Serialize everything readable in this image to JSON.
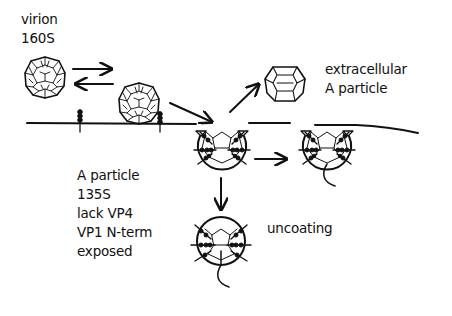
{
  "diagram": {
    "type": "schematic",
    "colors": {
      "ink": "#111111",
      "background": "#ffffff"
    }
  },
  "labels": {
    "virion": "virion",
    "virion_s": "160S",
    "extracellular_line1": "extracellular",
    "extracellular_line2": "A particle",
    "a_particle_line1": "A particle",
    "a_particle_line2": "135S",
    "a_particle_line3": "lack VP4",
    "a_particle_line4": "VP1 N-term",
    "a_particle_line5": "exposed",
    "uncoating": "uncoating"
  },
  "nodes": [
    {
      "id": "free-virion",
      "kind": "virion-160S",
      "label_ref": "virion"
    },
    {
      "id": "receptor-bound-virion",
      "kind": "virion-160S"
    },
    {
      "id": "extracellular-a-particle",
      "kind": "A-particle"
    },
    {
      "id": "membrane-a-particle-1",
      "kind": "A-particle-in-membrane"
    },
    {
      "id": "membrane-a-particle-2",
      "kind": "A-particle-with-RNA"
    },
    {
      "id": "uncoating-particle",
      "kind": "uncoating-particle"
    }
  ],
  "edges": [
    {
      "from": "free-virion",
      "to": "receptor-bound-virion",
      "style": "reversible"
    },
    {
      "from": "receptor-bound-virion",
      "to": "membrane-a-particle-1"
    },
    {
      "from": "membrane-a-particle-1",
      "to": "extracellular-a-particle"
    },
    {
      "from": "membrane-a-particle-1",
      "to": "membrane-a-particle-2"
    },
    {
      "from": "membrane-a-particle-1",
      "to": "uncoating-particle"
    }
  ]
}
